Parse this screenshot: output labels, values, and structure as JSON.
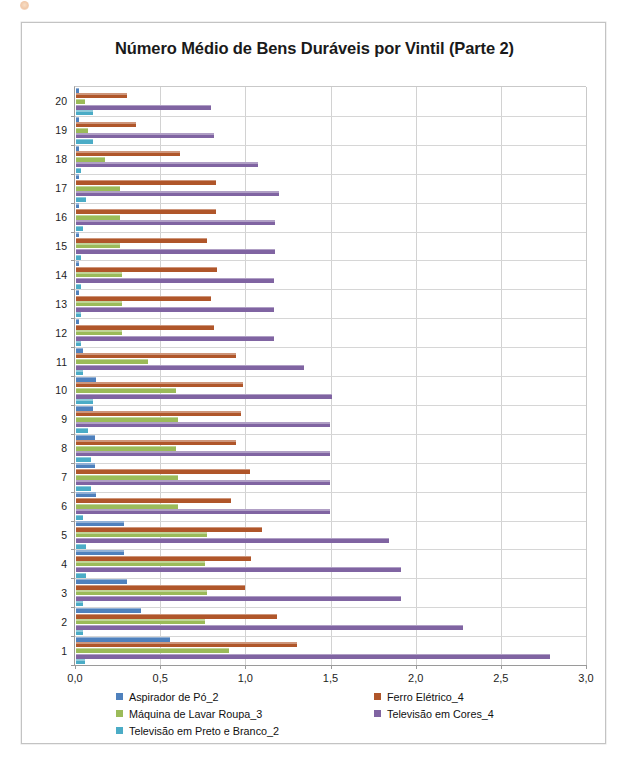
{
  "chart_data": {
    "type": "bar",
    "orientation": "horizontal",
    "title": "Número Médio de Bens Duráveis por Vintil (Parte 2)",
    "xlabel": "",
    "ylabel": "",
    "xlim": [
      0.0,
      3.0
    ],
    "xticks": [
      0.0,
      0.5,
      1.0,
      1.5,
      2.0,
      2.5,
      3.0
    ],
    "xtick_labels": [
      "0,0",
      "0,5",
      "1,0",
      "1,5",
      "2,0",
      "2,5",
      "3,0"
    ],
    "grid": "vertical-and-horizontal",
    "legend_position": "bottom",
    "categories": [
      "1",
      "2",
      "3",
      "4",
      "5",
      "6",
      "7",
      "8",
      "9",
      "10",
      "11",
      "12",
      "13",
      "14",
      "15",
      "16",
      "17",
      "18",
      "19",
      "20"
    ],
    "series": [
      {
        "name": "Aspirador de Pó_2",
        "color": "#4F81BD",
        "values": [
          0.55,
          0.38,
          0.3,
          0.28,
          0.28,
          0.12,
          0.11,
          0.11,
          0.1,
          0.12,
          0.04,
          0.02,
          0.02,
          0.02,
          0.02,
          0.02,
          0.02,
          0.02,
          0.02,
          0.02
        ]
      },
      {
        "name": "Ferro Elétrico_4",
        "color": "#B0562A",
        "values": [
          1.3,
          1.18,
          0.99,
          1.03,
          1.09,
          0.91,
          1.02,
          0.94,
          0.97,
          0.98,
          0.94,
          0.81,
          0.79,
          0.83,
          0.77,
          0.82,
          0.82,
          0.61,
          0.35,
          0.3
        ]
      },
      {
        "name": "Máquina de Lavar Roupa_3",
        "color": "#9BBB59",
        "values": [
          0.9,
          0.76,
          0.77,
          0.76,
          0.77,
          0.6,
          0.6,
          0.59,
          0.6,
          0.59,
          0.42,
          0.27,
          0.27,
          0.27,
          0.26,
          0.26,
          0.26,
          0.17,
          0.07,
          0.05
        ]
      },
      {
        "name": "Televisão em Cores_4",
        "color": "#8064A2",
        "values": [
          2.78,
          2.27,
          1.91,
          1.91,
          1.84,
          1.49,
          1.49,
          1.49,
          1.49,
          1.5,
          1.34,
          1.16,
          1.16,
          1.16,
          1.17,
          1.17,
          1.19,
          1.07,
          0.81,
          0.79
        ]
      },
      {
        "name": "Televisão em Preto e Branco_2",
        "color": "#4BACC6",
        "values": [
          0.05,
          0.04,
          0.04,
          0.06,
          0.06,
          0.04,
          0.09,
          0.09,
          0.07,
          0.1,
          0.04,
          0.03,
          0.03,
          0.03,
          0.03,
          0.04,
          0.06,
          0.03,
          0.1,
          0.1
        ]
      }
    ]
  },
  "legend": {
    "columns": [
      {
        "items": [
          {
            "label": "Aspirador de Pó_2",
            "color": "#4F81BD"
          },
          {
            "label": "Máquina de Lavar Roupa_3",
            "color": "#9BBB59"
          },
          {
            "label": "Televisão em Preto e Branco_2",
            "color": "#4BACC6"
          }
        ]
      },
      {
        "items": [
          {
            "label": "Ferro Elétrico_4",
            "color": "#B0562A"
          },
          {
            "label": "Televisão em Cores_4",
            "color": "#8064A2"
          }
        ]
      }
    ]
  }
}
